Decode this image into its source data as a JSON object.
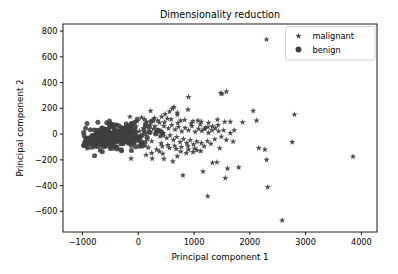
{
  "chart_data": {
    "type": "scatter",
    "title": "Dimensionality reduction",
    "xlabel": "Principal component 1",
    "ylabel": "Principal component 2",
    "xlim": [
      -1350,
      4280
    ],
    "ylim": [
      -760,
      855
    ],
    "xticks": [
      -1000,
      0,
      1000,
      2000,
      3000,
      4000
    ],
    "xticklabels": [
      "−1000",
      "0",
      "1000",
      "2000",
      "3000",
      "4000"
    ],
    "yticks": [
      -600,
      -400,
      -200,
      0,
      200,
      400,
      600,
      800
    ],
    "yticklabels": [
      "−600",
      "−400",
      "−200",
      "0",
      "200",
      "400",
      "600",
      "800"
    ],
    "grid": false,
    "legend_position": "upper right",
    "marker_color": "#3f3f3f",
    "series": [
      {
        "name": "malignant",
        "marker": "star",
        "color": "#3f3f3f",
        "points": [
          [
            2300,
            735
          ],
          [
            1580,
            330
          ],
          [
            1500,
            312
          ],
          [
            900,
            288
          ],
          [
            1480,
            318
          ],
          [
            2060,
            180
          ],
          [
            2800,
            152
          ],
          [
            220,
            180
          ],
          [
            640,
            210
          ],
          [
            610,
            198
          ],
          [
            890,
            190
          ],
          [
            2120,
            105
          ],
          [
            1870,
            92
          ],
          [
            1420,
            112
          ],
          [
            -150,
            135
          ],
          [
            60,
            128
          ],
          [
            420,
            135
          ],
          [
            700,
            150
          ],
          [
            520,
            120
          ],
          [
            760,
            105
          ],
          [
            980,
            100
          ],
          [
            1130,
            95
          ],
          [
            1260,
            88
          ],
          [
            1330,
            60
          ],
          [
            1530,
            30
          ],
          [
            1650,
            8
          ],
          [
            1700,
            -58
          ],
          [
            2160,
            -108
          ],
          [
            2270,
            -120
          ],
          [
            2300,
            -200
          ],
          [
            2760,
            -62
          ],
          [
            3850,
            -175
          ],
          [
            2320,
            -412
          ],
          [
            2580,
            -670
          ],
          [
            1245,
            -482
          ],
          [
            1160,
            -290
          ],
          [
            1330,
            -222
          ],
          [
            1410,
            -218
          ],
          [
            1600,
            -268
          ],
          [
            1800,
            -258
          ],
          [
            1560,
            -342
          ],
          [
            800,
            -320
          ],
          [
            460,
            -192
          ],
          [
            250,
            -190
          ],
          [
            -130,
            -190
          ],
          [
            620,
            -212
          ],
          [
            700,
            -172
          ],
          [
            980,
            -140
          ],
          [
            1050,
            -125
          ],
          [
            1120,
            -132
          ],
          [
            860,
            -148
          ],
          [
            900,
            -120
          ],
          [
            760,
            -135
          ],
          [
            680,
            -115
          ],
          [
            560,
            -108
          ],
          [
            430,
            -95
          ],
          [
            330,
            -120
          ],
          [
            180,
            -105
          ],
          [
            120,
            -92
          ],
          [
            40,
            -85
          ],
          [
            -60,
            -72
          ],
          [
            300,
            60
          ],
          [
            380,
            88
          ],
          [
            460,
            62
          ],
          [
            540,
            45
          ],
          [
            600,
            70
          ],
          [
            660,
            35
          ],
          [
            720,
            55
          ],
          [
            780,
            20
          ],
          [
            840,
            48
          ],
          [
            900,
            30
          ],
          [
            960,
            62
          ],
          [
            1020,
            18
          ],
          [
            1080,
            42
          ],
          [
            1140,
            25
          ],
          [
            1200,
            50
          ],
          [
            1260,
            10
          ],
          [
            1320,
            30
          ],
          [
            1380,
            45
          ],
          [
            1440,
            22
          ],
          [
            150,
            95
          ],
          [
            210,
            70
          ],
          [
            270,
            40
          ],
          [
            330,
            12
          ],
          [
            390,
            -18
          ],
          [
            450,
            8
          ],
          [
            510,
            -30
          ],
          [
            570,
            -10
          ],
          [
            630,
            -45
          ],
          [
            690,
            -22
          ],
          [
            750,
            -62
          ],
          [
            810,
            -38
          ],
          [
            870,
            -70
          ],
          [
            930,
            -48
          ],
          [
            990,
            -80
          ],
          [
            1050,
            -58
          ],
          [
            90,
            45
          ],
          [
            20,
            22
          ],
          [
            -40,
            60
          ],
          [
            -100,
            38
          ],
          [
            240,
            -55
          ],
          [
            160,
            -40
          ],
          [
            80,
            -62
          ],
          [
            0,
            -48
          ],
          [
            1110,
            75
          ],
          [
            1180,
            -95
          ],
          [
            1250,
            55
          ],
          [
            1300,
            -75
          ],
          [
            1370,
            -40
          ],
          [
            1430,
            70
          ],
          [
            1490,
            -20
          ],
          [
            1550,
            95
          ],
          [
            350,
            105
          ],
          [
            410,
            -72
          ],
          [
            470,
            92
          ],
          [
            530,
            -85
          ],
          [
            590,
            115
          ],
          [
            650,
            -90
          ],
          [
            710,
            85
          ],
          [
            770,
            -100
          ],
          [
            830,
            110
          ],
          [
            890,
            -92
          ],
          [
            950,
            82
          ],
          [
            1010,
            -112
          ],
          [
            1070,
            105
          ],
          [
            1130,
            -70
          ],
          [
            1190,
            40
          ],
          [
            1240,
            -55
          ],
          [
            -20,
            100
          ],
          [
            -80,
            82
          ],
          [
            -170,
            55
          ],
          [
            110,
            115
          ],
          [
            290,
            125
          ],
          [
            480,
            155
          ],
          [
            560,
            175
          ],
          [
            700,
            165
          ],
          [
            440,
            -152
          ],
          [
            380,
            -135
          ],
          [
            240,
            -148
          ],
          [
            140,
            -162
          ],
          [
            1650,
            95
          ],
          [
            1720,
            30
          ],
          [
            1580,
            -45
          ],
          [
            1460,
            -110
          ]
        ]
      },
      {
        "name": "benign",
        "marker": "circle",
        "color": "#3f3f3f",
        "cluster_note": "dense elongated cluster centered near (-450, -25), extending from about -950 to 450 on PC1 and -110 to 110 on PC2",
        "cluster_center": [
          -450,
          -25
        ],
        "cluster_spread": [
          370,
          48
        ],
        "count": 357
      }
    ]
  },
  "legend": {
    "items": [
      {
        "label": "malignant",
        "marker": "star"
      },
      {
        "label": "benign",
        "marker": "circle"
      }
    ]
  }
}
